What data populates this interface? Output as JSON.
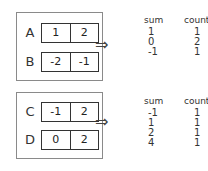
{
  "groups": [
    {
      "rows": [
        {
          "label": "A",
          "values": [
            "1",
            "2"
          ]
        },
        {
          "label": "B",
          "values": [
            "-2",
            "-1"
          ]
        }
      ],
      "arrow": "⇒",
      "result": {
        "headers": [
          "sum",
          "count"
        ],
        "rows": [
          [
            "1",
            "1"
          ],
          [
            "0",
            "2"
          ],
          [
            "-1",
            "1"
          ]
        ]
      }
    },
    {
      "rows": [
        {
          "label": "C",
          "values": [
            "-1",
            "2"
          ]
        },
        {
          "label": "D",
          "values": [
            "0",
            "2"
          ]
        }
      ],
      "arrow": "⇒",
      "result": {
        "headers": [
          "sum",
          "count"
        ],
        "rows": [
          [
            "-1",
            "1"
          ],
          [
            "1",
            "1"
          ],
          [
            "2",
            "1"
          ],
          [
            "4",
            "1"
          ]
        ]
      }
    }
  ]
}
